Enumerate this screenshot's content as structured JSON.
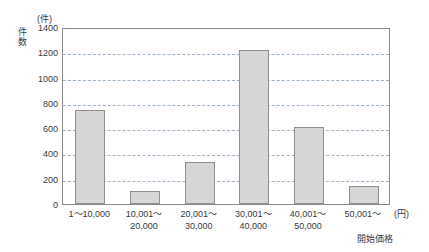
{
  "chart_data": {
    "type": "bar",
    "title": "",
    "categories": [
      "1～10,000",
      "10,001～\n20,000",
      "20,001～\n30,000",
      "30,001～\n40,000",
      "40,001～\n50,000",
      "50,001～"
    ],
    "values": [
      745,
      100,
      330,
      1215,
      610,
      140
    ],
    "xlabel": "開始価格",
    "xunit": "(円)",
    "ylabel": "件数",
    "yunit": "(件)",
    "ylim": [
      0,
      1400
    ],
    "ytick_values": [
      1400,
      1200,
      1000,
      800,
      600,
      400,
      200,
      0
    ],
    "ytick_labels": [
      "1400",
      "1200",
      "1000",
      "800",
      "600",
      "400",
      "200",
      "0"
    ],
    "grid": true,
    "legend": null,
    "colors": {
      "bar_fill": "#d6d6d6",
      "bar_border": "#8f8f8f",
      "axis": "#8a8a8a",
      "gridline": "#9fb4c9",
      "text": "#3a3a3a"
    }
  }
}
